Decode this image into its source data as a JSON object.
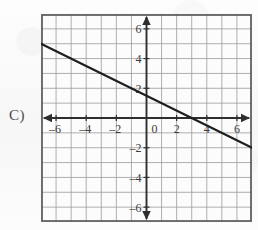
{
  "choice": {
    "label": "C)"
  },
  "colors": {
    "paper": "#fbfbfb",
    "frame": "#5a5a5a",
    "grid": "#9a9a9a",
    "axis": "#2e2e2e",
    "line": "#1f1f1f",
    "tick_text": "#3a3a3a"
  },
  "chart_data": {
    "type": "line",
    "title": "",
    "xlabel": "",
    "ylabel": "",
    "xlim": [
      -7,
      7
    ],
    "ylim": [
      -7,
      7
    ],
    "grid": true,
    "grid_step": 1,
    "legend": "none",
    "axis_arrows": [
      "left",
      "right",
      "up",
      "down"
    ],
    "x_ticks": [
      -6,
      -4,
      -2,
      0,
      2,
      4,
      6
    ],
    "x_tick_labels": [
      "–6",
      "–4",
      "–2",
      "0",
      "2",
      "4",
      "6"
    ],
    "y_ticks": [
      -6,
      -4,
      -2,
      2,
      4,
      6
    ],
    "y_tick_labels": [
      "–6",
      "–4",
      "–2",
      "2",
      "4",
      "6"
    ],
    "series": [
      {
        "name": "line",
        "equation": "y = -0.5x + 1.5",
        "slope": -0.5,
        "y_intercept": 1.5,
        "x_intercept": 3,
        "x": [
          -7,
          7
        ],
        "values": [
          5,
          -2
        ],
        "endpoints": [
          {
            "x": -7,
            "y": 5
          },
          {
            "x": 7,
            "y": -2
          }
        ]
      }
    ]
  }
}
